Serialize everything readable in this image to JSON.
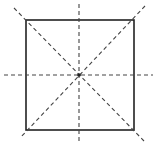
{
  "diagram": {
    "square": {
      "x": 26,
      "y": 20,
      "size": 108,
      "stroke": "#222222"
    },
    "symmetry_lines": [
      {
        "name": "vertical",
        "x1": 79,
        "y1": 4,
        "x2": 79,
        "y2": 142
      },
      {
        "name": "horizontal",
        "x1": 4,
        "y1": 75,
        "x2": 153,
        "y2": 75
      },
      {
        "name": "diagonal-down",
        "x1": 14,
        "y1": 8,
        "x2": 144,
        "y2": 141
      },
      {
        "name": "diagonal-up",
        "x1": 145,
        "y1": 6,
        "x2": 20,
        "y2": 138
      }
    ],
    "line_color": "#444444",
    "count": 4
  }
}
